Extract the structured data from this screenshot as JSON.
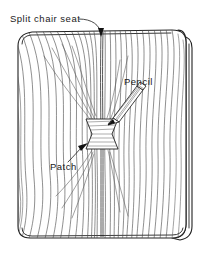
{
  "figure": {
    "type": "technical-line-drawing",
    "background_color": "#ffffff",
    "line_color": "#222222",
    "grain_color": "#4a4a4a",
    "labels": [
      {
        "id": "split-chair-seat",
        "text": "Split chair seat",
        "x": 10,
        "y": 22,
        "leader": "curve from text to arrowhead at top of split",
        "arrow_target_x": 101,
        "arrow_target_y": 36
      },
      {
        "id": "pencil",
        "text": "Pencil",
        "x": 124,
        "y": 85,
        "leader": "none",
        "arrow_target_x": 138,
        "arrow_target_y": 92
      },
      {
        "id": "patch",
        "text": "Patch",
        "x": 50,
        "y": 170,
        "leader": "line from text up-right to arrowhead at patch left edge",
        "arrow_target_x": 90,
        "arrow_target_y": 144
      }
    ],
    "objects": [
      {
        "id": "seat-panel",
        "name": "chair seat panel",
        "shape": "rounded-square board drawn in perspective with visible edge thickness",
        "corner_radius": 14
      },
      {
        "id": "wood-grain",
        "name": "wood grain lines",
        "count": 44,
        "direction": "vertical, wavy, converging toward the split"
      },
      {
        "id": "split-line",
        "name": "split / crack",
        "orientation": "vertical, full height of seat",
        "x": 101
      },
      {
        "id": "bowtie-patch",
        "name": "bowtie (butterfly) patch",
        "shape": "hourglass",
        "x": 86,
        "y": 119,
        "width": 32,
        "height": 30,
        "hatched": true
      },
      {
        "id": "pencil-tool",
        "name": "pencil",
        "orientation": "diagonal, tip pointing down-left at patch",
        "tip_x": 108,
        "tip_y": 122,
        "end_x": 141,
        "end_y": 89
      }
    ]
  }
}
